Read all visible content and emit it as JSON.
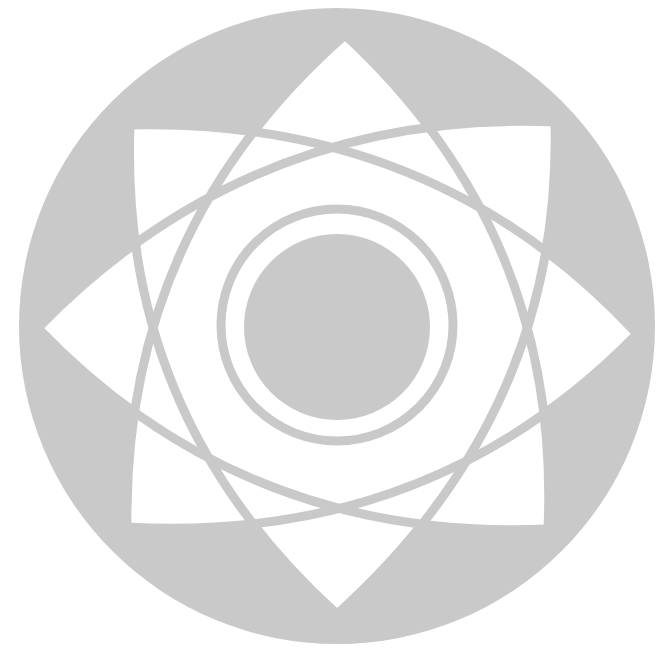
{
  "figure": {
    "colors": {
      "background": "#ffffff",
      "disc": "#c9c9c9",
      "star": "#ffffff",
      "lines": "#c9c9c9"
    },
    "outer_circle": {
      "cx": 337,
      "cy": 326,
      "r": 318
    },
    "center_disc": {
      "cx": 337,
      "cy": 327,
      "r": 93
    },
    "ring": {
      "cx": 337,
      "cy": 325,
      "r": 116,
      "stroke": 9
    },
    "tips": [
      {
        "name": "top",
        "x": 345,
        "y": 35
      },
      {
        "name": "top-right",
        "x": 555,
        "y": 122
      },
      {
        "name": "right",
        "x": 637,
        "y": 334
      },
      {
        "name": "bottom-right",
        "x": 548,
        "y": 529
      },
      {
        "name": "bottom",
        "x": 337,
        "y": 614
      },
      {
        "name": "bottom-left",
        "x": 127,
        "y": 527
      },
      {
        "name": "left",
        "x": 38,
        "y": 328
      },
      {
        "name": "top-left",
        "x": 130,
        "y": 125
      }
    ],
    "star_skip": 3,
    "curve_bulge": 62,
    "line_stroke": 9
  }
}
